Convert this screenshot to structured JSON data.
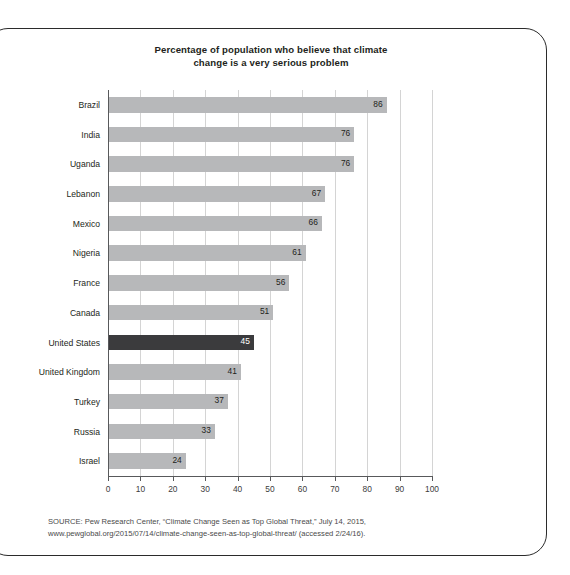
{
  "chart_data": {
    "type": "bar",
    "orientation": "horizontal",
    "title": "Percentage of population who believe that climate change is a very serious problem",
    "title_line1": "Percentage of population who believe that climate",
    "title_line2": "change is a very serious problem",
    "xlabel": "",
    "ylabel": "",
    "xlim": [
      0,
      100
    ],
    "xticks": [
      0,
      10,
      20,
      30,
      40,
      50,
      60,
      70,
      80,
      90,
      100
    ],
    "grid": "vertical",
    "legend": "none",
    "categories": [
      "Brazil",
      "India",
      "Uganda",
      "Lebanon",
      "Mexico",
      "Nigeria",
      "France",
      "Canada",
      "United States",
      "United Kingdom",
      "Turkey",
      "Russia",
      "Israel"
    ],
    "values": [
      86,
      76,
      76,
      67,
      66,
      61,
      56,
      51,
      45,
      41,
      37,
      33,
      24
    ],
    "highlighted_category": "United States",
    "bars": [
      {
        "label": "Brazil",
        "value": 86,
        "highlight": false
      },
      {
        "label": "India",
        "value": 76,
        "highlight": false
      },
      {
        "label": "Uganda",
        "value": 76,
        "highlight": false
      },
      {
        "label": "Lebanon",
        "value": 67,
        "highlight": false
      },
      {
        "label": "Mexico",
        "value": 66,
        "highlight": false
      },
      {
        "label": "Nigeria",
        "value": 61,
        "highlight": false
      },
      {
        "label": "France",
        "value": 56,
        "highlight": false
      },
      {
        "label": "Canada",
        "value": 51,
        "highlight": false
      },
      {
        "label": "United States",
        "value": 45,
        "highlight": true
      },
      {
        "label": "United Kingdom",
        "value": 41,
        "highlight": false
      },
      {
        "label": "Turkey",
        "value": 37,
        "highlight": false
      },
      {
        "label": "Russia",
        "value": 33,
        "highlight": false
      },
      {
        "label": "Israel",
        "value": 24,
        "highlight": false
      }
    ],
    "colors": {
      "bar": "#b7b8ba",
      "bar_highlight": "#3b3b3d",
      "gridline": "#d4d4d4",
      "axis": "#58595b",
      "text": "#231f20",
      "frame": "#2b2b2b",
      "background": "#ffffff"
    }
  },
  "source": {
    "line1": "SOURCE: Pew Research Center, “Climate Change Seen as Top Global Threat,” July 14, 2015,",
    "line2": "www.pewglobal.org/2015/07/14/climate-change-seen-as-top-global-threat/ (accessed 2/24/16)."
  }
}
